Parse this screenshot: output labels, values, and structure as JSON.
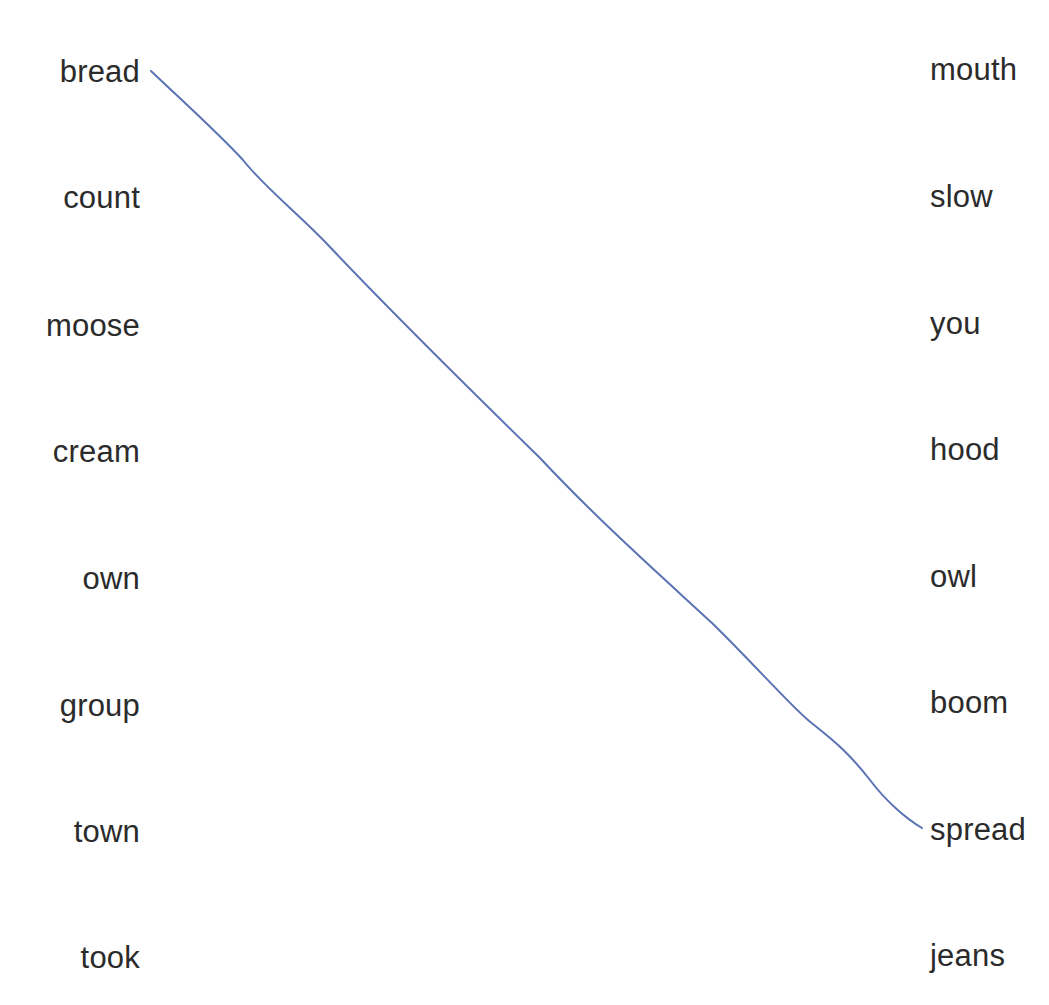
{
  "worksheet": {
    "type": "matching",
    "left_column": [
      {
        "label": "bread",
        "y": 52
      },
      {
        "label": "count",
        "y": 178
      },
      {
        "label": "moose",
        "y": 306
      },
      {
        "label": "cream",
        "y": 432
      },
      {
        "label": "own",
        "y": 559
      },
      {
        "label": "group",
        "y": 686
      },
      {
        "label": "town",
        "y": 812
      },
      {
        "label": "took",
        "y": 938
      }
    ],
    "right_column": [
      {
        "label": "mouth",
        "y": 50
      },
      {
        "label": "slow",
        "y": 177
      },
      {
        "label": "you",
        "y": 304
      },
      {
        "label": "hood",
        "y": 430
      },
      {
        "label": "owl",
        "y": 557
      },
      {
        "label": "boom",
        "y": 683
      },
      {
        "label": "spread",
        "y": 810
      },
      {
        "label": "jeans",
        "y": 936
      }
    ],
    "connections": [
      {
        "from": "bread",
        "to": "spread",
        "color": "#5a73b5",
        "path": "M151,71 C190,108 220,135 243,160 C265,188 300,215 330,247 C380,300 450,370 540,458 C600,522 660,575 712,623 C750,660 790,705 808,720 C830,738 845,748 870,780 C885,800 905,818 922,828"
      }
    ]
  }
}
